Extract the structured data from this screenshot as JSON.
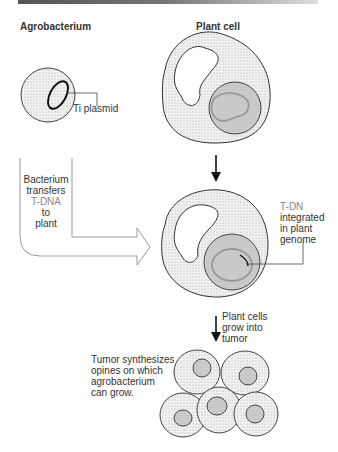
{
  "headers": {
    "left": "Agrobacterium",
    "right": "Plant cell"
  },
  "labels": {
    "ti_plasmid": "Ti plasmid",
    "transfer": [
      "Bacterium",
      "transfers",
      "T-DNA",
      "to",
      "plant"
    ],
    "integrated": [
      "T-DN",
      "integrated",
      "in plant",
      "genome"
    ],
    "grow": [
      "Plant cells",
      "grow into",
      "tumor"
    ],
    "tumor": [
      "Tumor synthesizes",
      "opines on which",
      "agrobacterium",
      "can grow."
    ]
  },
  "colors": {
    "stipple": "#d8d8d8",
    "outline": "#333",
    "tdna": "#999"
  }
}
